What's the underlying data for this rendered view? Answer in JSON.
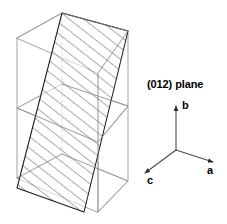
{
  "figure": {
    "plane_label": "(012) plane",
    "axes": {
      "b": {
        "label": "b",
        "direction": "up"
      },
      "a": {
        "label": "a",
        "direction": "lower-right"
      },
      "c": {
        "label": "c",
        "direction": "lower-left"
      }
    },
    "colors": {
      "background": "#ffffff",
      "cell_edge": "#8c8c8c",
      "plane_edge": "#1a1a1a",
      "hatch": "#3a3a3a",
      "hidden_edge": "#9a9a9a",
      "axis": "#4a4a4a",
      "text": "#000000"
    },
    "geometry": {
      "cell": {
        "front_bottom_left": [
          17,
          178
        ],
        "front_bottom_right": [
          98,
          212
        ],
        "front_top_left": [
          17,
          38
        ],
        "front_top_right": [
          98,
          73
        ],
        "back_bottom_left": [
          62,
          154
        ],
        "back_bottom_right": [
          128,
          181
        ],
        "back_top_left": [
          62,
          13
        ],
        "back_top_right": [
          128,
          31
        ],
        "mid_level_y_left": 108,
        "mid_level_y_right": 106
      },
      "plane": {
        "vertices": [
          [
            17,
            188
          ],
          [
            62,
            13
          ],
          [
            128,
            31
          ],
          [
            84,
            212
          ]
        ],
        "hatch_spacing_px": 9,
        "hatch_angle_deg": 35
      },
      "axis_origin": [
        176,
        150
      ],
      "axis_b_tip": [
        176,
        104
      ],
      "axis_a_tip": [
        215,
        163
      ],
      "axis_c_tip": [
        143,
        174
      ]
    }
  }
}
